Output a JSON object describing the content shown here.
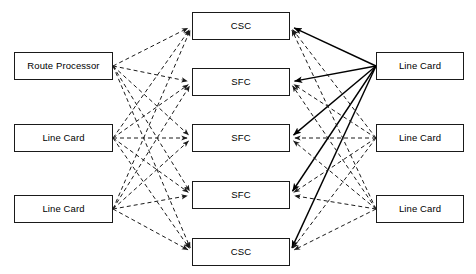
{
  "diagram": {
    "type": "bipartite-interconnect-diagram",
    "canvas": {
      "width": 476,
      "height": 274
    },
    "colors": {
      "background": "#ffffff",
      "box_border": "#1a1a1a",
      "box_fill": "#ffffff",
      "text": "#000000",
      "dashed_link": "#1a1a1a",
      "solid_link": "#000000"
    },
    "link_styles": {
      "dashed": {
        "dash_pattern": "4,3",
        "width": 1,
        "arrow": true
      },
      "solid": {
        "dash_pattern": "none",
        "width": 1.4,
        "arrow": true
      }
    }
  },
  "nodes": {
    "left_column": [
      {
        "id": "L0",
        "label": "Route Processor",
        "x": 14,
        "y": 52,
        "w": 99,
        "h": 28
      },
      {
        "id": "L1",
        "label": "Line Card",
        "x": 14,
        "y": 124,
        "w": 99,
        "h": 28
      },
      {
        "id": "L2",
        "label": "Line Card",
        "x": 14,
        "y": 195,
        "w": 99,
        "h": 28
      }
    ],
    "middle_column": [
      {
        "id": "M0",
        "label": "CSC",
        "x": 192,
        "y": 12,
        "w": 98,
        "h": 28
      },
      {
        "id": "M1",
        "label": "SFC",
        "x": 192,
        "y": 68,
        "w": 98,
        "h": 28
      },
      {
        "id": "M2",
        "label": "SFC",
        "x": 192,
        "y": 124,
        "w": 98,
        "h": 28
      },
      {
        "id": "M3",
        "label": "SFC",
        "x": 192,
        "y": 181,
        "w": 98,
        "h": 28
      },
      {
        "id": "M4",
        "label": "CSC",
        "x": 192,
        "y": 238,
        "w": 98,
        "h": 28
      }
    ],
    "right_column": [
      {
        "id": "R0",
        "label": "Line Card",
        "x": 376,
        "y": 52,
        "w": 88,
        "h": 28
      },
      {
        "id": "R1",
        "label": "Line Card",
        "x": 376,
        "y": 124,
        "w": 88,
        "h": 28
      },
      {
        "id": "R2",
        "label": "Line Card",
        "x": 376,
        "y": 195,
        "w": 88,
        "h": 28
      }
    ]
  },
  "links": {
    "left_to_middle": [
      {
        "from": "L0",
        "to": "M0",
        "style": "dashed"
      },
      {
        "from": "L0",
        "to": "M1",
        "style": "dashed"
      },
      {
        "from": "L0",
        "to": "M2",
        "style": "dashed"
      },
      {
        "from": "L0",
        "to": "M3",
        "style": "dashed"
      },
      {
        "from": "L0",
        "to": "M4",
        "style": "dashed"
      },
      {
        "from": "L1",
        "to": "M0",
        "style": "dashed"
      },
      {
        "from": "L1",
        "to": "M1",
        "style": "dashed"
      },
      {
        "from": "L1",
        "to": "M2",
        "style": "dashed"
      },
      {
        "from": "L1",
        "to": "M3",
        "style": "dashed"
      },
      {
        "from": "L1",
        "to": "M4",
        "style": "dashed"
      },
      {
        "from": "L2",
        "to": "M0",
        "style": "dashed"
      },
      {
        "from": "L2",
        "to": "M1",
        "style": "dashed"
      },
      {
        "from": "L2",
        "to": "M2",
        "style": "dashed"
      },
      {
        "from": "L2",
        "to": "M3",
        "style": "dashed"
      },
      {
        "from": "L2",
        "to": "M4",
        "style": "dashed"
      }
    ],
    "right_to_middle": [
      {
        "from": "R0",
        "to": "M0",
        "style": "solid"
      },
      {
        "from": "R0",
        "to": "M1",
        "style": "solid"
      },
      {
        "from": "R0",
        "to": "M2",
        "style": "solid"
      },
      {
        "from": "R0",
        "to": "M3",
        "style": "solid"
      },
      {
        "from": "R0",
        "to": "M4",
        "style": "solid"
      },
      {
        "from": "R1",
        "to": "M0",
        "style": "dashed"
      },
      {
        "from": "R1",
        "to": "M1",
        "style": "dashed"
      },
      {
        "from": "R1",
        "to": "M2",
        "style": "dashed"
      },
      {
        "from": "R1",
        "to": "M3",
        "style": "dashed"
      },
      {
        "from": "R1",
        "to": "M4",
        "style": "dashed"
      },
      {
        "from": "R2",
        "to": "M0",
        "style": "dashed"
      },
      {
        "from": "R2",
        "to": "M1",
        "style": "dashed"
      },
      {
        "from": "R2",
        "to": "M2",
        "style": "dashed"
      },
      {
        "from": "R2",
        "to": "M3",
        "style": "dashed"
      },
      {
        "from": "R2",
        "to": "M4",
        "style": "dashed"
      }
    ]
  }
}
